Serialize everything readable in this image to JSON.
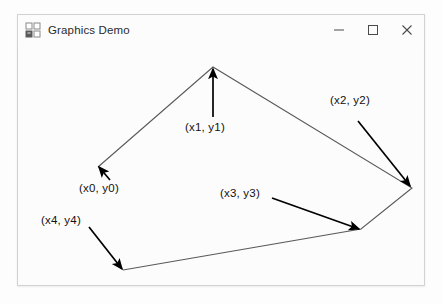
{
  "window": {
    "title": "Graphics Demo",
    "icon": "app-window-grid-icon",
    "controls": {
      "minimize": "–",
      "maximize": "□",
      "close": "✕"
    },
    "frame_color": "#d2d2d2",
    "background": "#fcfcfc"
  },
  "drawing": {
    "stroke_color": "#5a5a5a",
    "annotation_color": "#000000",
    "polygon": {
      "name": "polyline-five-points",
      "closed": false,
      "points": [
        {
          "id": "p0",
          "label": "(x0, y0)",
          "x": 97,
          "y": 166
        },
        {
          "id": "p1",
          "label": "(x1, y1)",
          "x": 212,
          "y": 66
        },
        {
          "id": "p2",
          "label": "(x2, y2)",
          "x": 411,
          "y": 187
        },
        {
          "id": "p3",
          "label": "(x3, y3)",
          "x": 360,
          "y": 228
        },
        {
          "id": "p4",
          "label": "(x4, y4)",
          "x": 122,
          "y": 269
        }
      ]
    },
    "annotations": [
      {
        "id": "a0",
        "text": "(x0, y0)",
        "text_x": 78,
        "text_y": 181,
        "arrow_from_x": 109,
        "arrow_from_y": 179,
        "arrow_to_x": 98,
        "arrow_to_y": 166
      },
      {
        "id": "a1",
        "text": "(x1, y1)",
        "text_x": 184,
        "text_y": 120,
        "arrow_from_x": 212,
        "arrow_from_y": 116,
        "arrow_to_x": 212,
        "arrow_to_y": 68
      },
      {
        "id": "a2",
        "text": "(x2, y2)",
        "text_x": 329,
        "text_y": 93,
        "arrow_from_x": 357,
        "arrow_from_y": 120,
        "arrow_to_x": 409,
        "arrow_to_y": 185
      },
      {
        "id": "a3",
        "text": "(x3, y3)",
        "text_x": 219,
        "text_y": 186,
        "arrow_from_x": 271,
        "arrow_from_y": 197,
        "arrow_to_x": 358,
        "arrow_to_y": 228
      },
      {
        "id": "a4",
        "text": "(x4, y4)",
        "text_x": 40,
        "text_y": 213,
        "arrow_from_x": 88,
        "arrow_from_y": 226,
        "arrow_to_x": 121,
        "arrow_to_y": 268
      }
    ]
  }
}
